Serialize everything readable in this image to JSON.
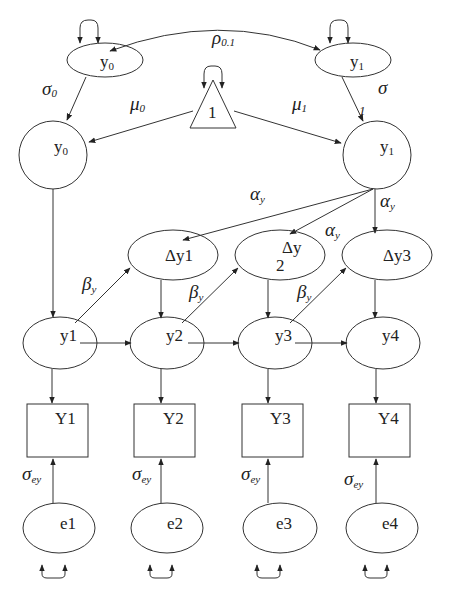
{
  "nodes": {
    "top_y0": {
      "label": "y",
      "sub": "0"
    },
    "top_y1": {
      "label": "y",
      "sub": "1"
    },
    "constant": {
      "label": "1"
    },
    "circle_y0": {
      "label": "y",
      "sub": "0"
    },
    "circle_y1": {
      "label": "y",
      "sub": "1"
    },
    "dy1": {
      "label": "Δy1"
    },
    "dy2_line1": {
      "label": "Δy"
    },
    "dy2_line2": {
      "label": "2"
    },
    "dy3": {
      "label": "Δy3"
    },
    "y1": {
      "label": "y1"
    },
    "y2": {
      "label": "y2"
    },
    "y3": {
      "label": "y3"
    },
    "y4": {
      "label": "y4"
    },
    "Y1": {
      "label": "Y1"
    },
    "Y2": {
      "label": "Y2"
    },
    "Y3": {
      "label": "Y3"
    },
    "Y4": {
      "label": "Y4"
    },
    "e1": {
      "label": "e1"
    },
    "e2": {
      "label": "e2"
    },
    "e3": {
      "label": "e3"
    },
    "e4": {
      "label": "e4"
    }
  },
  "edge_labels": {
    "rho": {
      "label": "ρ",
      "sub": "0.1"
    },
    "sigma0": {
      "label": "σ",
      "sub": "0"
    },
    "sigma": {
      "label": "σ"
    },
    "one": {
      "label": "1"
    },
    "mu0": {
      "label": "μ",
      "sub": "0"
    },
    "mu1": {
      "label": "μ",
      "sub": "1"
    },
    "alpha_1": {
      "label": "α",
      "sub": "y"
    },
    "alpha_2": {
      "label": "α",
      "sub": "y"
    },
    "alpha_3": {
      "label": "α",
      "sub": "y"
    },
    "beta_1": {
      "label": "β",
      "sub": "y"
    },
    "beta_2": {
      "label": "β",
      "sub": "y"
    },
    "beta_3": {
      "label": "β",
      "sub": "y"
    },
    "sigma_ey_1": {
      "label": "σ",
      "sub": "ey"
    },
    "sigma_ey_2": {
      "label": "σ",
      "sub": "ey"
    },
    "sigma_ey_3": {
      "label": "σ",
      "sub": "ey"
    },
    "sigma_ey_4": {
      "label": "σ",
      "sub": "ey"
    }
  },
  "colors": {
    "stroke": "#333333",
    "background": "#ffffff"
  }
}
